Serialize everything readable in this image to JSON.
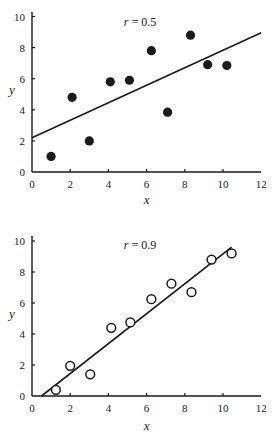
{
  "chart_data": [
    {
      "type": "scatter",
      "title": "",
      "annotation": {
        "var": "r",
        "eq": " = ",
        "value": "0.5"
      },
      "xlabel": "x",
      "ylabel": "y",
      "xlim": [
        0,
        12
      ],
      "ylim": [
        0,
        10
      ],
      "xticks": [
        0,
        2,
        4,
        6,
        8,
        10,
        12
      ],
      "yticks": [
        0,
        2,
        4,
        6,
        8,
        10
      ],
      "grid": false,
      "marker": "filled-circle",
      "points": [
        {
          "x": 1.0,
          "y": 1.0
        },
        {
          "x": 2.1,
          "y": 4.8
        },
        {
          "x": 3.0,
          "y": 2.0
        },
        {
          "x": 4.1,
          "y": 5.8
        },
        {
          "x": 5.1,
          "y": 5.9
        },
        {
          "x": 6.25,
          "y": 7.8
        },
        {
          "x": 7.1,
          "y": 3.85
        },
        {
          "x": 8.3,
          "y": 8.8
        },
        {
          "x": 9.2,
          "y": 6.9
        },
        {
          "x": 10.2,
          "y": 6.85
        }
      ],
      "fit_line": {
        "x0": 0,
        "y0": 2.2,
        "x1": 12,
        "y1": 8.95
      }
    },
    {
      "type": "scatter",
      "title": "",
      "annotation": {
        "var": "r",
        "eq": " = ",
        "value": "0.9"
      },
      "xlabel": "x",
      "ylabel": "y",
      "xlim": [
        0,
        12
      ],
      "ylim": [
        0,
        10
      ],
      "xticks": [
        0,
        2,
        4,
        6,
        8,
        10,
        12
      ],
      "yticks": [
        0,
        2,
        4,
        6,
        8,
        10
      ],
      "grid": false,
      "marker": "open-circle",
      "points": [
        {
          "x": 1.25,
          "y": 0.4
        },
        {
          "x": 2.0,
          "y": 1.95
        },
        {
          "x": 3.05,
          "y": 1.4
        },
        {
          "x": 4.15,
          "y": 4.4
        },
        {
          "x": 5.15,
          "y": 4.75
        },
        {
          "x": 6.25,
          "y": 6.25
        },
        {
          "x": 7.3,
          "y": 7.25
        },
        {
          "x": 8.35,
          "y": 6.7
        },
        {
          "x": 9.4,
          "y": 8.8
        },
        {
          "x": 10.45,
          "y": 9.2
        }
      ],
      "fit_line": {
        "x0": 0.5,
        "y0": 0,
        "x1": 10.45,
        "y1": 9.6
      }
    }
  ]
}
